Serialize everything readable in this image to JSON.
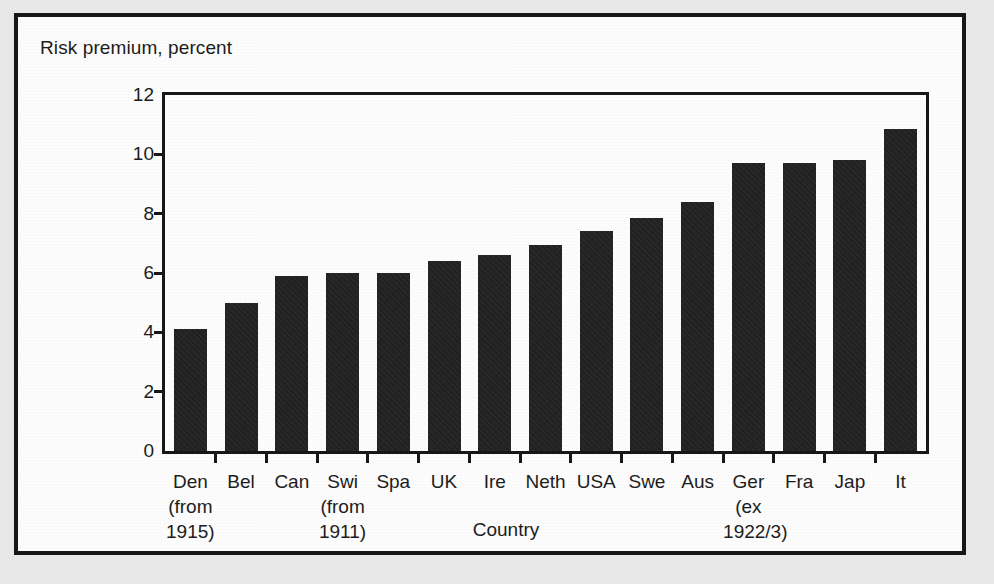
{
  "figure": {
    "frame_color": "#171717",
    "paper_color": "#ebebeb",
    "plot_background": "#ffffff"
  },
  "chart_data": {
    "type": "bar",
    "title": "",
    "ylabel": "Risk premium, percent",
    "xlabel": "Country",
    "ylim": [
      0,
      12
    ],
    "yticks": [
      0,
      2,
      4,
      6,
      8,
      10,
      12
    ],
    "ytick_labels": [
      "0",
      "2",
      "4",
      "6",
      "8",
      "10",
      "12"
    ],
    "grid": false,
    "legend": false,
    "bar_color": "#1b1b1b",
    "categories": [
      "Den",
      "Bel",
      "Can",
      "Swi",
      "Spa",
      "UK",
      "Ire",
      "Neth",
      "USA",
      "Swe",
      "Aus",
      "Ger",
      "Fra",
      "Jap",
      "It"
    ],
    "category_annotations": [
      "(from 1915)",
      "",
      "",
      "(from 1911)",
      "",
      "",
      "",
      "",
      "",
      "",
      "",
      "(ex 1922/3)",
      "",
      "",
      ""
    ],
    "values": [
      4.1,
      5.0,
      5.9,
      6.0,
      6.0,
      6.4,
      6.6,
      6.95,
      7.4,
      7.85,
      8.4,
      9.7,
      9.72,
      9.82,
      10.85
    ]
  },
  "x_labels": [
    {
      "main": "Den",
      "sub1": "(from",
      "sub2": "1915)"
    },
    {
      "main": "Bel",
      "sub1": "",
      "sub2": ""
    },
    {
      "main": "Can",
      "sub1": "",
      "sub2": ""
    },
    {
      "main": "Swi",
      "sub1": "(from",
      "sub2": "1911)"
    },
    {
      "main": "Spa",
      "sub1": "",
      "sub2": ""
    },
    {
      "main": "UK",
      "sub1": "",
      "sub2": ""
    },
    {
      "main": "Ire",
      "sub1": "",
      "sub2": ""
    },
    {
      "main": "Neth",
      "sub1": "",
      "sub2": ""
    },
    {
      "main": "USA",
      "sub1": "",
      "sub2": ""
    },
    {
      "main": "Swe",
      "sub1": "",
      "sub2": ""
    },
    {
      "main": "Aus",
      "sub1": "",
      "sub2": ""
    },
    {
      "main": "Ger",
      "sub1": "(ex",
      "sub2": "1922/3)"
    },
    {
      "main": "Fra",
      "sub1": "",
      "sub2": ""
    },
    {
      "main": "Jap",
      "sub1": "",
      "sub2": ""
    },
    {
      "main": "It",
      "sub1": "",
      "sub2": ""
    }
  ]
}
